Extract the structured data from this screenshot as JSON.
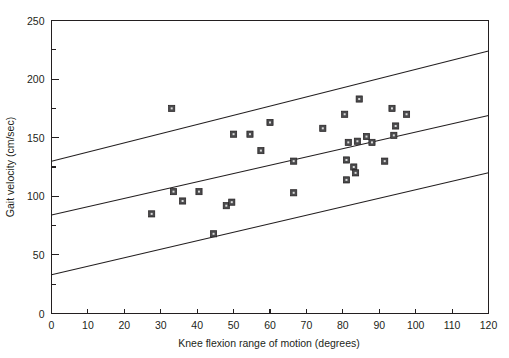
{
  "chart_data": {
    "type": "scatter",
    "title": "",
    "xlabel": "Knee flexion range of motion (degrees)",
    "ylabel": "Gait velocity (cm/sec)",
    "xlim": [
      0,
      120
    ],
    "ylim": [
      0,
      250
    ],
    "xticks": [
      0,
      10,
      20,
      30,
      40,
      50,
      60,
      70,
      80,
      90,
      100,
      110,
      120
    ],
    "yticks": [
      0,
      50,
      100,
      150,
      200,
      250
    ],
    "y_minor_ticks": [
      25,
      75,
      125,
      175,
      225
    ],
    "grid": false,
    "legend": null,
    "marker_style": "filled-square-with-light-center",
    "points": [
      {
        "x": 27.5,
        "y": 85
      },
      {
        "x": 33.0,
        "y": 175
      },
      {
        "x": 33.5,
        "y": 104
      },
      {
        "x": 36.0,
        "y": 96
      },
      {
        "x": 40.5,
        "y": 104
      },
      {
        "x": 44.5,
        "y": 68
      },
      {
        "x": 48.0,
        "y": 92
      },
      {
        "x": 49.5,
        "y": 95
      },
      {
        "x": 50.0,
        "y": 153
      },
      {
        "x": 54.5,
        "y": 153
      },
      {
        "x": 57.5,
        "y": 139
      },
      {
        "x": 60.0,
        "y": 163
      },
      {
        "x": 66.5,
        "y": 103
      },
      {
        "x": 66.5,
        "y": 130
      },
      {
        "x": 74.5,
        "y": 158
      },
      {
        "x": 80.5,
        "y": 170
      },
      {
        "x": 81.0,
        "y": 114
      },
      {
        "x": 81.0,
        "y": 131
      },
      {
        "x": 81.5,
        "y": 146
      },
      {
        "x": 83.0,
        "y": 125
      },
      {
        "x": 83.5,
        "y": 120
      },
      {
        "x": 84.0,
        "y": 147
      },
      {
        "x": 84.5,
        "y": 183
      },
      {
        "x": 86.5,
        "y": 151
      },
      {
        "x": 88.0,
        "y": 146
      },
      {
        "x": 91.5,
        "y": 130
      },
      {
        "x": 93.5,
        "y": 175
      },
      {
        "x": 94.0,
        "y": 152
      },
      {
        "x": 94.5,
        "y": 160
      },
      {
        "x": 97.5,
        "y": 170
      }
    ],
    "lines": [
      {
        "name": "upper-confidence-band",
        "x0": 0,
        "y0": 130,
        "x1": 120,
        "y1": 224
      },
      {
        "name": "regression-line",
        "x0": 0,
        "y0": 84,
        "x1": 120,
        "y1": 169
      },
      {
        "name": "lower-confidence-band",
        "x0": 0,
        "y0": 33,
        "x1": 120,
        "y1": 120
      }
    ]
  },
  "axes": {
    "x": {
      "title": "Knee flexion range of motion (degrees)",
      "labels": [
        "0",
        "10",
        "20",
        "30",
        "40",
        "50",
        "60",
        "70",
        "80",
        "90",
        "100",
        "110",
        "120"
      ]
    },
    "y": {
      "title": "Gait velocity (cm/sec)",
      "labels": [
        "0",
        "50",
        "100",
        "150",
        "200",
        "250"
      ]
    }
  },
  "colors": {
    "ink": "#231f20",
    "marker_fill": "#4b4b4d",
    "marker_center": "#d9d9d9",
    "background": "#ffffff"
  }
}
